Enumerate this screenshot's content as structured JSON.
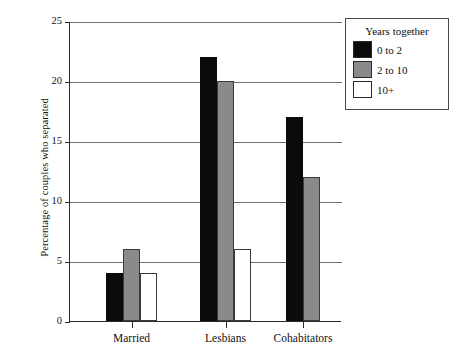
{
  "chart_data": {
    "type": "bar",
    "title": "",
    "xlabel": "",
    "ylabel": "Percentage of couples who separated",
    "categories": [
      "Married",
      "Lesbians",
      "Cohabitators"
    ],
    "ylim": [
      0,
      25
    ],
    "yticks": [
      0,
      5,
      10,
      15,
      20,
      25
    ],
    "ytick_labels": [
      "0",
      "5",
      "10",
      "15",
      "20",
      "25"
    ],
    "grid": true,
    "legend_position": "top-right",
    "legend_title": "Years together",
    "series": [
      {
        "name": "0 to 2",
        "color": "#0b0b0b",
        "values": [
          4,
          22,
          17
        ]
      },
      {
        "name": "2 to 10",
        "color": "#8a8a8a",
        "values": [
          6,
          20,
          12
        ]
      },
      {
        "name": "10+",
        "color": "#ffffff",
        "values": [
          4,
          6,
          null
        ]
      }
    ]
  }
}
